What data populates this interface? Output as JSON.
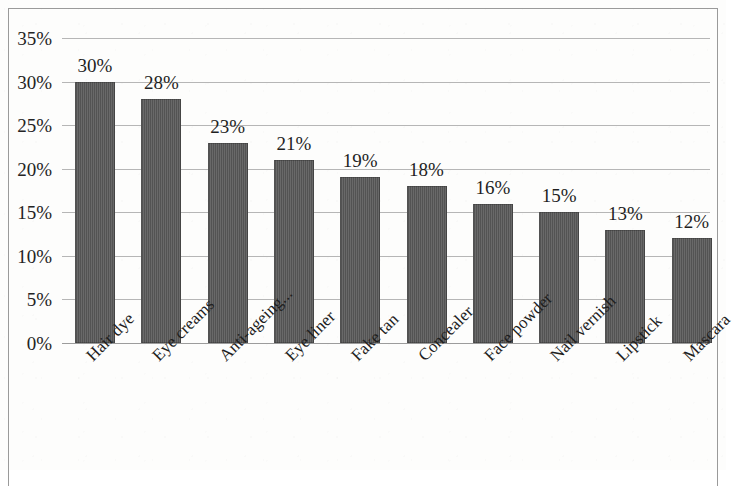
{
  "chart_data": {
    "type": "bar",
    "title": "",
    "subtitle": "",
    "xlabel": "",
    "ylabel": "",
    "ylim": [
      0,
      35
    ],
    "grid": true,
    "legend": false,
    "orientation": "vertical",
    "value_labels_shown": true,
    "value_label_suffix": "%",
    "bar_color": "#585858",
    "gridline_color": "#b6b6b6",
    "frame_color": "#9a9a9a",
    "background_color": "#fdfdfc",
    "categories": [
      "Hair dye",
      "Eye creams",
      "Anti-ageing...",
      "Eye liner",
      "Fake tan",
      "Concealer",
      "Face powder",
      "Nail vernish",
      "Lipstick",
      "Mascara"
    ],
    "values": [
      30,
      28,
      23,
      21,
      19,
      18,
      16,
      15,
      13,
      12
    ],
    "value_labels": [
      "30%",
      "28%",
      "23%",
      "21%",
      "19%",
      "18%",
      "16%",
      "15%",
      "13%",
      "12%"
    ],
    "y_ticks": [
      35,
      30,
      25,
      20,
      15,
      10,
      5,
      0
    ],
    "y_tick_labels": [
      "35%",
      "30%",
      "25%",
      "20%",
      "15%",
      "10%",
      "5%",
      "0%"
    ]
  }
}
